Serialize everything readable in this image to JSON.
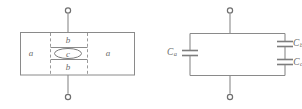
{
  "figure": {
    "stroke_color": "#8a8a8a",
    "text_color": "#6b6b6b",
    "background_color": "#ffffff"
  },
  "left_diagram": {
    "name": "capacitor-cross-section",
    "regions": [
      {
        "id": "a-left",
        "label": "a",
        "x": 31,
        "y": 53
      },
      {
        "id": "b-top",
        "label": "b",
        "x": 68,
        "y": 40
      },
      {
        "id": "c-center",
        "label": "c",
        "x": 68,
        "y": 53
      },
      {
        "id": "b-bottom",
        "label": "b",
        "x": 68,
        "y": 67
      },
      {
        "id": "a-right",
        "label": "a",
        "x": 108,
        "y": 53
      }
    ],
    "terminals": [
      {
        "id": "top-terminal",
        "x": 68,
        "y": 10
      },
      {
        "id": "bottom-terminal",
        "x": 68,
        "y": 97
      }
    ]
  },
  "right_diagram": {
    "name": "equivalent-circuit",
    "capacitors": [
      {
        "id": "c-a",
        "symbol": "C",
        "subscript": "a",
        "label_x": 172,
        "label_y": 53,
        "position": "left-branch"
      },
      {
        "id": "c-b",
        "symbol": "C",
        "subscript": "b",
        "label_x": 290,
        "label_y": 44,
        "position": "right-branch-upper"
      },
      {
        "id": "c-c",
        "symbol": "C",
        "subscript": "c",
        "label_x": 290,
        "label_y": 63,
        "position": "right-branch-lower"
      }
    ],
    "terminals": [
      {
        "id": "top-terminal",
        "x": 230,
        "y": 10
      },
      {
        "id": "bottom-terminal",
        "x": 230,
        "y": 97
      }
    ]
  }
}
